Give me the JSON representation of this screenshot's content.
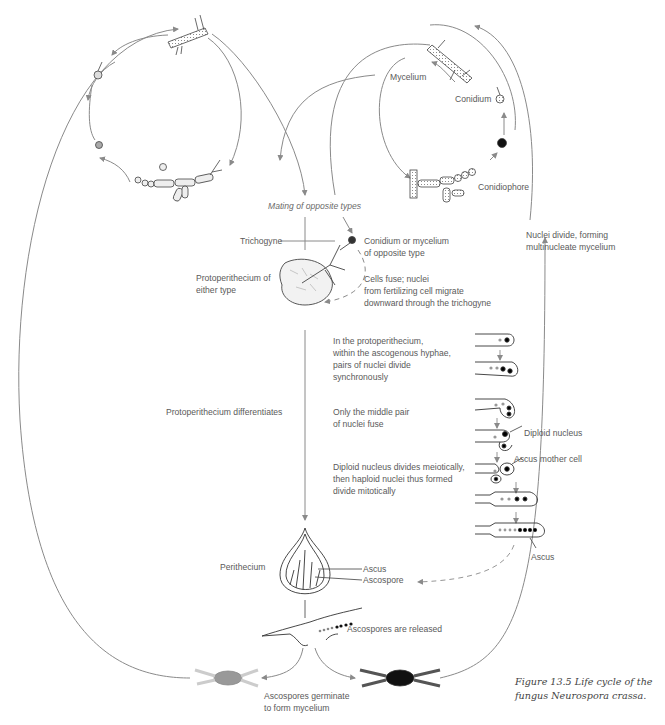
{
  "figure": {
    "caption_line1": "Figure 13.5   Life cycle of the",
    "caption_line2": "fungus Neurospora crassa."
  },
  "asexual_cycle": {
    "mycelium": "Mycelium",
    "conidium": "Conidium",
    "conidiophore": "Conidiophore",
    "nuclei_divide_1": "Nuclei divide, forming",
    "nuclei_divide_2": "multinucleate mycelium"
  },
  "mating": {
    "title": "Mating of opposite types",
    "trichogyne": "Trichogyne",
    "conidium_or_mycelium_1": "Conidium or mycelium",
    "conidium_or_mycelium_2": "of opposite type",
    "protoperithecium_1": "Protoperithecium of",
    "protoperithecium_2": "either type",
    "cells_fuse_1": "Cells fuse; nuclei",
    "cells_fuse_2": "from fertilizing cell migrate",
    "cells_fuse_3": "downward through the trichogyne"
  },
  "development": {
    "differentiates": "Protoperithecium differentiates",
    "step1_1": "In the protoperithecium,",
    "step1_2": "within the ascogenous hyphae,",
    "step1_3": "pairs of nuclei divide",
    "step1_4": "synchronously",
    "step2_1": "Only the middle pair",
    "step2_2": "of nuclei fuse",
    "diploid_nucleus": "Diploid nucleus",
    "step3_1": "Diploid nucleus divides meiotically,",
    "step3_2": "then haploid nuclei thus formed",
    "step3_3": "divide mitotically",
    "ascus_mother_cell": "Ascus mother cell",
    "ascus_bottom": "Ascus"
  },
  "perithecium": {
    "label": "Perithecium",
    "ascus": "Ascus",
    "ascospore": "Ascospore",
    "released": "Ascospores are released",
    "germinate_1": "Ascospores germinate",
    "germinate_2": "to form mycelium"
  },
  "colors": {
    "line": "#8a8a8a",
    "ink": "#333333",
    "text": "#5a5a5a"
  }
}
